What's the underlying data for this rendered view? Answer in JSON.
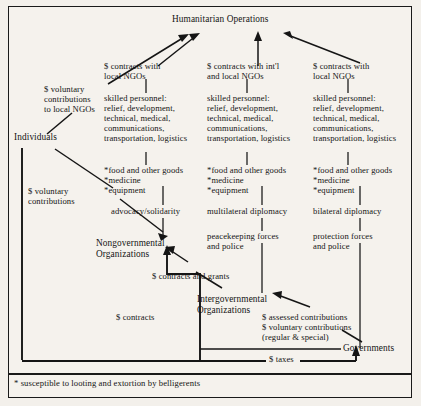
{
  "diagram": {
    "top_node": "Humanitarian Operations",
    "footnote": "* susceptible to looting and extortion by belligerents",
    "columns": [
      {
        "id": "col-ngo",
        "contracts": "$ contracts with\nlocal NGOs",
        "personnel": "skilled personnel:\nrelief, development,\ntechnical, medical,\ncommunications,\ntransportation, logistics",
        "goods": "*food and other goods\n*medicine\n*equipment",
        "activity": "advocacy/solidarity",
        "force": ""
      },
      {
        "id": "col-igo",
        "contracts": "$ contracts with int'l\nand local NGOs",
        "personnel": "skilled personnel:\nrelief, development,\ntechnical, medical,\ncommunications,\ntransportation, logistics",
        "goods": "*food and other goods\n*medicine\n*equipment",
        "activity": "multilateral diplomacy",
        "force": "peacekeeping forces\nand police"
      },
      {
        "id": "col-gov",
        "contracts": "$ contracts with\nlocal NGOs",
        "personnel": "skilled personnel:\nrelief, development,\ntechnical, medical,\ncommunications,\ntransportation, logistics",
        "goods": "*food and other goods\n*medicine\n*equipment",
        "activity": "bilateral diplomacy",
        "force": "protection forces\nand police"
      }
    ],
    "actors": {
      "individuals": "Individuals",
      "ngo": "Nongovernmental\nOrganizations",
      "igo": "Intergovernmental\nOrganizations",
      "governments": "Governments"
    },
    "flow_labels": {
      "voluntary_to_local_ngos": "$ voluntary\ncontributions\nto local NGOs",
      "voluntary_contributions": "$ voluntary\ncontributions",
      "contracts_and_grants": "$ contracts and grants",
      "contracts": "$ contracts",
      "assessed_and_voluntary": "$ assessed contributions\n$ voluntary contributions\n(regular & special)",
      "taxes": "$ taxes"
    },
    "colors": {
      "ink": "#141414",
      "paper": "#f5f2ed",
      "page": "#f3f0eb"
    }
  }
}
